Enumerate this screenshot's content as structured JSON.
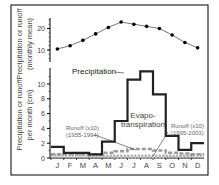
{
  "chart_data": [
    {
      "type": "line",
      "panel": "top",
      "ylabel": "Temperature (°C) (monthly mean)",
      "ylabel_line1": "Temperature (°C)",
      "ylabel_line2": "(monthly mean)",
      "categories": [
        "J",
        "F",
        "M",
        "A",
        "M",
        "J",
        "J",
        "A",
        "S",
        "O",
        "N",
        "D"
      ],
      "yticks": [
        10,
        20
      ],
      "ylim": [
        5,
        25
      ],
      "series": [
        {
          "name": "Temperature",
          "values": [
            10.5,
            12,
            14.5,
            17.5,
            20.5,
            23,
            22,
            21,
            20,
            17,
            13.5,
            11
          ]
        }
      ]
    },
    {
      "type": "line",
      "panel": "bottom",
      "ylabel": "Precipitation or runoff per month (cm)",
      "ylabel_line1": "Precipitation or runoff",
      "ylabel_line2": "per month (cm)",
      "categories": [
        "J",
        "F",
        "M",
        "A",
        "M",
        "J",
        "J",
        "A",
        "S",
        "O",
        "N",
        "D"
      ],
      "yticks": [
        0,
        2,
        4,
        6,
        8,
        10
      ],
      "ylim": [
        0,
        12.5
      ],
      "series": [
        {
          "name": "Precipitation",
          "style": "step",
          "values": [
            1.5,
            0.7,
            0.7,
            0.5,
            2.2,
            5.0,
            10.6,
            11.7,
            8.6,
            3.0,
            1.1,
            2.0
          ]
        },
        {
          "name": "Evapotranspiration",
          "style": "dashed",
          "values": [
            0.5,
            0.5,
            0.5,
            0.5,
            0.7,
            0.9,
            1.2,
            1.2,
            1.0,
            0.7,
            0.6,
            0.5
          ]
        },
        {
          "name": "Runoff (x10) (1955-1994)",
          "style": "dotted",
          "values": [
            0.4,
            0.4,
            0.4,
            0.3,
            0.3,
            0.3,
            0.3,
            0.3,
            0.3,
            0.3,
            0.3,
            0.4
          ]
        },
        {
          "name": "Runoff (x10) (1995-2003)",
          "style": "dotted-light",
          "values": [
            0.2,
            0.2,
            0.2,
            0.2,
            0.2,
            0.1,
            0.1,
            0.1,
            0.1,
            0.2,
            0.2,
            0.2
          ]
        }
      ],
      "annotations": [
        {
          "text": "Precipitation"
        },
        {
          "text": "Evapo-",
          "text2": "transpiration"
        },
        {
          "text": "Runoff (x10)",
          "text2": "(1955-1994)"
        },
        {
          "text": "Runoff (x10)",
          "text2": "(1995-2003)"
        }
      ]
    }
  ]
}
